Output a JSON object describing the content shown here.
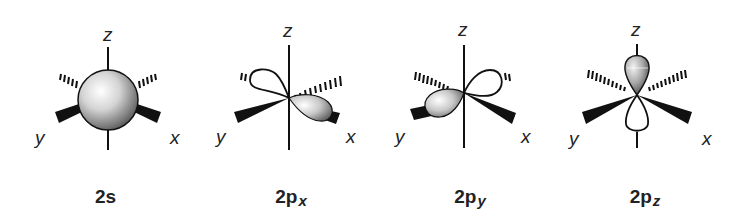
{
  "figure": {
    "axis_labels": {
      "x": "x",
      "y": "y",
      "z": "z"
    },
    "colors": {
      "ink": "#111111",
      "shade_light": "#ffffff",
      "shade_dark": "#6a6a6a",
      "background": "#ffffff"
    }
  },
  "orbitals": [
    {
      "id": "2s",
      "label_main": "2s",
      "label_sub": "",
      "shape": "sphere"
    },
    {
      "id": "2px",
      "label_main": "2p",
      "label_sub": "x",
      "shape": "dumbbell-x"
    },
    {
      "id": "2py",
      "label_main": "2p",
      "label_sub": "y",
      "shape": "dumbbell-y"
    },
    {
      "id": "2pz",
      "label_main": "2p",
      "label_sub": "z",
      "shape": "dumbbell-z"
    }
  ]
}
